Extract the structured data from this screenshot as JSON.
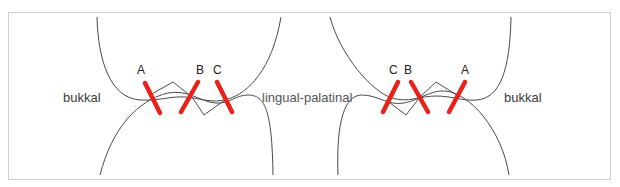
{
  "diagram": {
    "left": {
      "side_outer": "bukkal",
      "contacts": [
        {
          "label": "A"
        },
        {
          "label": "B"
        },
        {
          "label": "C"
        }
      ]
    },
    "center_label": "lingual-palatinal",
    "right": {
      "side_outer": "bukkal",
      "contacts": [
        {
          "label": "C"
        },
        {
          "label": "B"
        },
        {
          "label": "A"
        }
      ]
    },
    "colors": {
      "contact_mark": "#e8221a",
      "outline": "#4a4a4a",
      "frame": "#c9d0d6"
    }
  }
}
